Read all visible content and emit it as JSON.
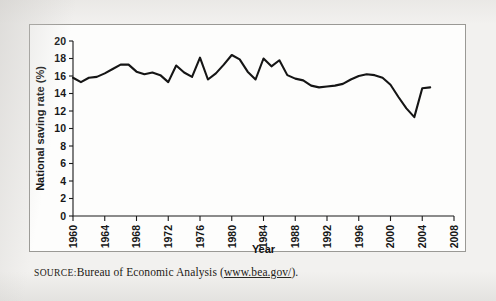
{
  "figure": {
    "caption_prefix": "SOURCE:",
    "caption_body": "Bureau of Economic Analysis (",
    "caption_link": "www.bea.gov/",
    "caption_suffix": ")."
  },
  "chart_data": {
    "type": "line",
    "title": "",
    "xlabel": "Year",
    "ylabel": "National saving rate (%)",
    "xlim": [
      1960,
      2008
    ],
    "ylim": [
      0,
      20
    ],
    "xticks": [
      1960,
      1964,
      1968,
      1972,
      1976,
      1980,
      1984,
      1988,
      1992,
      1996,
      2000,
      2004,
      2008
    ],
    "yticks": [
      0,
      2,
      4,
      6,
      8,
      10,
      12,
      14,
      16,
      18,
      20
    ],
    "xtick_labels": [
      "1960",
      "1964",
      "1968",
      "1972",
      "1976",
      "1980",
      "1984",
      "1988",
      "1992",
      "1996",
      "2000",
      "2004",
      "2008"
    ],
    "ytick_labels": [
      "0",
      "2",
      "4",
      "6",
      "8",
      "10",
      "12",
      "14",
      "16",
      "18",
      "20"
    ],
    "grid": false,
    "legend": false,
    "line_color": "#151515",
    "x": [
      1960,
      1961,
      1962,
      1963,
      1964,
      1965,
      1966,
      1967,
      1968,
      1969,
      1970,
      1971,
      1972,
      1973,
      1974,
      1975,
      1976,
      1977,
      1978,
      1979,
      1980,
      1981,
      1982,
      1983,
      1984,
      1985,
      1986,
      1987,
      1988,
      1989,
      1990,
      1991,
      1992,
      1993,
      1994,
      1995,
      1996,
      1997,
      1998,
      1999,
      2000,
      2001,
      2002,
      2003,
      2004,
      2005
    ],
    "values": [
      15.8,
      15.3,
      15.8,
      15.9,
      16.3,
      16.8,
      17.3,
      17.3,
      16.5,
      16.2,
      16.4,
      16.1,
      15.3,
      17.2,
      16.4,
      15.9,
      18.1,
      15.6,
      16.3,
      17.3,
      18.4,
      17.9,
      16.5,
      15.6,
      18.0,
      17.1,
      17.8,
      16.1,
      15.7,
      15.5,
      14.9,
      14.7,
      14.8,
      14.9,
      15.1,
      15.6,
      16.0,
      16.2,
      16.1,
      15.8,
      15.0,
      13.6,
      12.3,
      11.3,
      14.6,
      14.7
    ]
  },
  "labels": {
    "y_axis_title": "National saving rate (%)",
    "x_axis_title": "Year"
  }
}
